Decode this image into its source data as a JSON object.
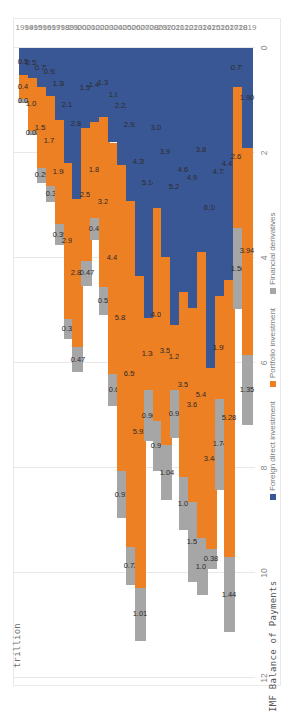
{
  "chart_data": {
    "type": "bar",
    "orientation": "stacked-horizontal-rotated",
    "title": "",
    "xlabel": "",
    "ylabel": "trillion",
    "ylim": [
      0,
      12
    ],
    "yticks": [
      "0",
      "2",
      "4",
      "6",
      "8",
      "10",
      "12"
    ],
    "grid": true,
    "legend_position": "bottom",
    "source": "IMF Balance of Payments",
    "categories": [
      "1994",
      "1995",
      "1996",
      "1997",
      "1998",
      "1999",
      "2000",
      "2001",
      "2002",
      "2003",
      "2004",
      "2005",
      "2006",
      "2007",
      "2008",
      "2009",
      "2010",
      "2011",
      "2012",
      "2013",
      "2014",
      "2015",
      "2016",
      "2017",
      "2018",
      "2019"
    ],
    "series": [
      {
        "name": "Foreign direct investment",
        "color": "#3a5795",
        "values": [
          0.52,
          0.57,
          0.75,
          0.92,
          1.38,
          2.19,
          2.88,
          1.53,
          1.41,
          1.32,
          1.8,
          2.22,
          2.92,
          4.35,
          5.14,
          3.05,
          3.98,
          5.28,
          4.65,
          4.96,
          3.88,
          6.1,
          4.73,
          4.41,
          0.75,
          1.9
        ],
        "labels": [
          "0.52",
          "0.57",
          "0.75",
          "0.92",
          "1.38",
          "2.19",
          "2.88",
          "1.53",
          "1.41",
          "1.32",
          "1.8",
          "2.22",
          "2.92",
          "4.35",
          "5.14",
          "3.05",
          "3.98",
          "5.28",
          "4.65",
          "4.96",
          "3.88",
          "6.10",
          "4.73",
          "4.41",
          "0.75",
          "1.90"
        ]
      },
      {
        "name": "Portfolio investment",
        "color": "#ed8023",
        "values": [
          0.46,
          1.01,
          1.53,
          1.71,
          1.98,
          2.97,
          2.82,
          2.53,
          1.82,
          3.24,
          4.41,
          5.83,
          6.59,
          5.93,
          1.38,
          4.06,
          3.59,
          1.23,
          3.53,
          3.68,
          5.46,
          3.44,
          1.95,
          5.28,
          2.67,
          3.94
        ],
        "labels": [
          "0.46",
          "1.01",
          "1.53",
          "1.71",
          "1.98",
          "2.97",
          "2.82",
          "2.53",
          "1.82",
          "3.24",
          "4.41",
          "5.83",
          "6.59",
          "5.93",
          "1.38",
          "4.06",
          "3.59",
          "1.23",
          "3.53",
          "3.68",
          "5.46",
          "3.44",
          "1.95",
          "5.28",
          "2.67",
          "3.94"
        ]
      },
      {
        "name": "Financial derivatives",
        "color": "#a6a6a6",
        "values": [
          0.06,
          0.08,
          0.29,
          0.3,
          0.39,
          0.38,
          0.47,
          0.47,
          0.42,
          0.53,
          0.6,
          0.91,
          0.72,
          1.01,
          0.96,
          0.95,
          1.04,
          0.92,
          1.0,
          1.54,
          1.08,
          0.38,
          1.74,
          1.44,
          1.56,
          1.35
        ],
        "labels": [
          "0.06",
          "0.08",
          "0.29",
          "0.3",
          "0.39",
          "0.38",
          "0.47",
          "0.47",
          "0.42",
          "0.53",
          "0.6",
          "0.91",
          "0.72",
          "1.01",
          "0.96",
          "0.95",
          "1.04",
          "0.92",
          "1.00",
          "1.54",
          "1.08",
          "0.38",
          "1.74",
          "1.44",
          "1.56",
          "1.35"
        ]
      }
    ]
  },
  "axis": {
    "y_title": "trillion"
  },
  "legend": {
    "items": [
      {
        "label": "Foreign direct investment",
        "color": "#3a5795"
      },
      {
        "label": "Portfolio investment",
        "color": "#ed8023"
      },
      {
        "label": "Financial derivatives",
        "color": "#a6a6a6"
      }
    ]
  },
  "footer": {
    "source": "IMF Balance of Payments"
  }
}
